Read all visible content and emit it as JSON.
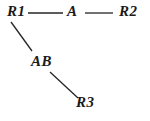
{
  "diagram": {
    "type": "node-link-graph",
    "background_color": "#ffffff",
    "line_color": "#262626",
    "text_color": "#1a1a1a",
    "nodes": [
      {
        "id": "R1",
        "label": "R1",
        "x": 18,
        "y": 12
      },
      {
        "id": "A",
        "label": "A",
        "x": 72,
        "y": 12
      },
      {
        "id": "R2",
        "label": "R2",
        "x": 130,
        "y": 12
      },
      {
        "id": "AB",
        "label": "AB",
        "x": 42,
        "y": 62
      },
      {
        "id": "R3",
        "label": "R3",
        "x": 87,
        "y": 103
      }
    ],
    "edges": [
      {
        "from": "R1",
        "to": "A",
        "x1": 28,
        "y1": 13,
        "x2": 63,
        "y2": 13
      },
      {
        "from": "A",
        "to": "R2",
        "x1": 85,
        "y1": 13,
        "x2": 113,
        "y2": 13
      },
      {
        "from": "R1",
        "to": "AB",
        "x1": 11,
        "y1": 22,
        "x2": 32,
        "y2": 51
      },
      {
        "from": "AB",
        "to": "R3",
        "x1": 50,
        "y1": 72,
        "x2": 78,
        "y2": 98
      }
    ]
  }
}
